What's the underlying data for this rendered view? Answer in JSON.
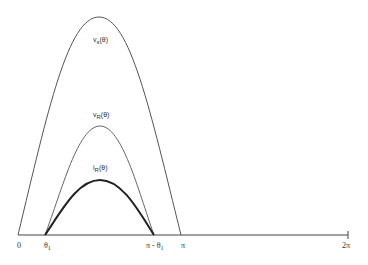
{
  "diagram": {
    "title": "",
    "curves": [
      {
        "name": "vs",
        "label_main": "v",
        "label_sub": "s",
        "label_arg": "(θ)",
        "start_x": "0",
        "end_x": "π",
        "peak_rel": 1.0
      },
      {
        "name": "vR",
        "label_main": "v",
        "label_sub": "R",
        "label_arg": "(θ)",
        "start_x": "θ1",
        "end_x": "π - θ1",
        "peak_rel": 0.48
      },
      {
        "name": "iR",
        "label_main": "i",
        "label_sub": "R",
        "label_arg": "(θ)",
        "start_x": "θ1",
        "end_x": "π - θ1",
        "peak_rel": 0.3
      }
    ],
    "x_ticks": {
      "zero": "0",
      "theta1_main": "θ",
      "theta1_sub": "1",
      "pi_minus_theta1_main": "π - θ",
      "pi_minus_theta1_sub": "1",
      "pi": "π",
      "two_pi": "2π"
    },
    "colors": {
      "axis": "#444444",
      "vs": "#555555",
      "vR": "#666666",
      "iR": "#222222"
    }
  }
}
